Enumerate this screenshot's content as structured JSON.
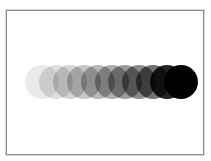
{
  "scene": {
    "description": "Row of overlapping circles with increasing opacity forming a motion trail",
    "frame_color": "#8c8c8c",
    "background_color": "#ffffff",
    "circle_color": "#000000",
    "circle_count": 11,
    "circle_radius": 17,
    "center_y": 82,
    "first_center_x": 42,
    "spacing_x": 13.9,
    "opacities": [
      0.08,
      0.12,
      0.17,
      0.22,
      0.27,
      0.32,
      0.38,
      0.45,
      0.55,
      0.85,
      1.0
    ]
  }
}
